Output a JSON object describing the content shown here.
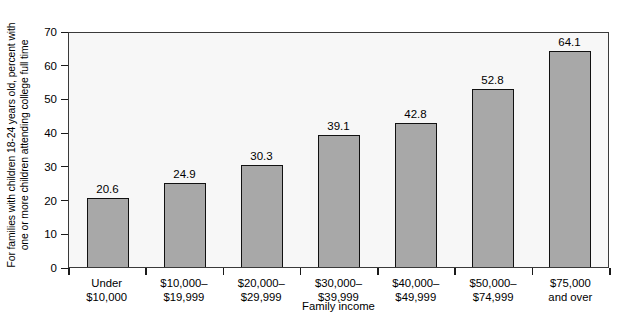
{
  "chart_data": {
    "type": "bar",
    "title": "",
    "xlabel": "Family income",
    "ylabel_lines": [
      "For families with children 18-24 years old, percent with",
      "one or more children attending college full time"
    ],
    "ylabel": "For families with children 18-24 years old, percent with one or more children attending college full time",
    "categories": [
      "Under $10,000",
      "$10,000–$19,999",
      "$20,000–$29,999",
      "$30,000–$39,999",
      "$40,000–$49,999",
      "$50,000–$74,999",
      "$75,000 and over"
    ],
    "category_lines": [
      [
        "Under",
        "$10,000"
      ],
      [
        "$10,000–",
        "$19,999"
      ],
      [
        "$20,000–",
        "$29,999"
      ],
      [
        "$30,000–",
        "$39,999"
      ],
      [
        "$40,000–",
        "$49,999"
      ],
      [
        "$50,000–",
        "$74,999"
      ],
      [
        "$75,000",
        "and over"
      ]
    ],
    "values": [
      20.6,
      24.9,
      30.3,
      39.1,
      42.8,
      52.8,
      64.1
    ],
    "value_labels": [
      "20.6",
      "24.9",
      "30.3",
      "39.1",
      "42.8",
      "52.8",
      "64.1"
    ],
    "ylim": [
      0,
      70
    ],
    "yticks": [
      0,
      10,
      20,
      30,
      40,
      50,
      60,
      70
    ],
    "ytick_labels": [
      "0",
      "10",
      "20",
      "30",
      "40",
      "50",
      "60",
      "70"
    ],
    "grid": false,
    "legend": false,
    "colors": {
      "bar_fill": "#a8a8a8",
      "bar_border": "#111111",
      "plot_background": "#f7f7f7",
      "axis": "#3a3a3a",
      "text": "#000000",
      "page_background": "#ffffff"
    }
  }
}
